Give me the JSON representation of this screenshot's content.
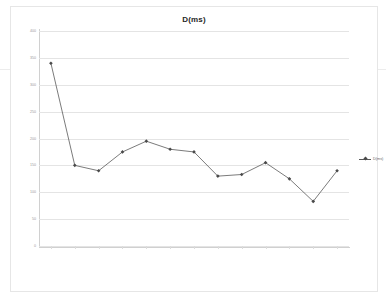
{
  "chart": {
    "title": "D(ms)",
    "legend": {
      "entry_label": "D(ms)",
      "position": "right",
      "marker": "diamond-line-marker"
    }
  },
  "chart_data": {
    "type": "line",
    "title": "D(ms)",
    "xlabel": "",
    "ylabel": "",
    "ylim": [
      0,
      400
    ],
    "yticks": [
      0,
      50,
      100,
      150,
      200,
      250,
      300,
      350,
      400
    ],
    "grid": true,
    "legend_position": "right",
    "series": [
      {
        "name": "D(ms)",
        "color": "#595959",
        "marker": "diamond",
        "values": [
          340,
          150,
          140,
          175,
          195,
          180,
          175,
          130,
          133,
          155,
          125,
          83,
          140
        ]
      }
    ],
    "categories": [
      "1月",
      "2月",
      "3月",
      "4月",
      "5月",
      "6月",
      "7月",
      "8月",
      "9月上旬",
      "10月",
      "11月",
      "12月",
      "1月"
    ]
  }
}
